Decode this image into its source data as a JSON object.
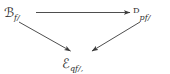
{
  "diagram": {
    "kind": "commutative-triangle",
    "background_color": "#ffffff",
    "ink_color": "#2b2b2b",
    "nodes": [
      {
        "id": "c",
        "position": "top-left",
        "main": "ℬ",
        "main_plain": "C",
        "subscript": "f/",
        "tail": "",
        "full_text": "C_{f/}"
      },
      {
        "id": "d",
        "position": "top-right",
        "main": "ᴰ",
        "main_plain": "D",
        "subscript": "pf/",
        "tail": "",
        "full_text": "D_{pf/}"
      },
      {
        "id": "e",
        "position": "bottom-center",
        "main": "ℰ",
        "main_plain": "E",
        "subscript": "qf/",
        "tail": ",",
        "full_text": "E_{qf/},"
      }
    ],
    "arrows": [
      {
        "id": "c-to-d",
        "from": "c",
        "to": "d",
        "label": "",
        "direction": "horizontal-right",
        "head": "arrowhead"
      },
      {
        "id": "c-to-e",
        "from": "c",
        "to": "e",
        "label": "",
        "direction": "diagonal-down-right",
        "head": "arrowhead"
      },
      {
        "id": "d-to-e",
        "from": "d",
        "to": "e",
        "label": "",
        "direction": "diagonal-down-left",
        "head": "arrowhead"
      }
    ]
  }
}
